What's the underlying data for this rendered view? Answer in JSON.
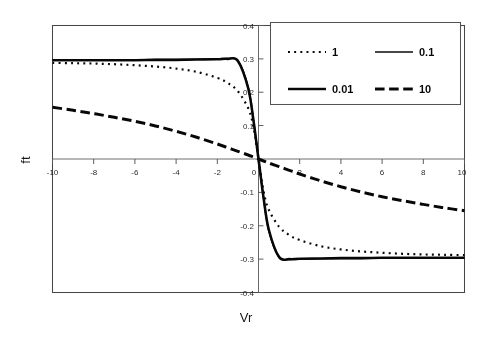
{
  "chart_data": {
    "type": "line",
    "title": "",
    "subtitle": "",
    "xlabel": "Vr",
    "ylabel": "ft",
    "xlim": [
      -10,
      10
    ],
    "ylim": [
      -0.4,
      0.4
    ],
    "grid": false,
    "legend_position": "top-right",
    "xticks": [
      -10,
      -8,
      -6,
      -4,
      -2,
      0,
      2,
      4,
      6,
      8,
      10
    ],
    "xtick_labels": [
      "-10",
      "-8",
      "-6",
      "-4",
      "-2",
      "0",
      "2",
      "4",
      "6",
      "8",
      "10"
    ],
    "yticks": [
      -0.4,
      -0.3,
      -0.2,
      -0.1,
      0,
      0.1,
      0.2,
      0.3,
      0.4
    ],
    "ytick_labels": [
      "-0.4",
      "-0.3",
      "-0.2",
      "-0.1",
      "0",
      "0.1",
      "0.2",
      "0.3",
      "0.4"
    ],
    "x": [
      -10,
      -9,
      -8,
      -7,
      -6,
      -5,
      -4,
      -3,
      -2,
      -1.5,
      -1,
      -0.5,
      -0.25,
      0,
      0.25,
      0.5,
      1,
      1.5,
      2,
      3,
      4,
      5,
      6,
      7,
      8,
      9,
      10
    ],
    "series": [
      {
        "name": "1",
        "label": "1",
        "style": "dotted",
        "width": 2.2,
        "color": "#111111",
        "values": [
          0.288,
          0.287,
          0.286,
          0.284,
          0.281,
          0.277,
          0.271,
          0.261,
          0.243,
          0.228,
          0.203,
          0.152,
          0.098,
          0.0,
          -0.098,
          -0.152,
          -0.203,
          -0.228,
          -0.243,
          -0.261,
          -0.271,
          -0.277,
          -0.281,
          -0.284,
          -0.286,
          -0.287,
          -0.288
        ]
      },
      {
        "name": "0.1",
        "label": "0.1",
        "style": "solid-thin",
        "width": 1.6,
        "color": "#111111",
        "values": [
          0.297,
          0.297,
          0.297,
          0.297,
          0.297,
          0.298,
          0.298,
          0.299,
          0.3,
          0.301,
          0.295,
          0.215,
          0.12,
          0.0,
          -0.12,
          -0.215,
          -0.295,
          -0.301,
          -0.3,
          -0.299,
          -0.298,
          -0.298,
          -0.297,
          -0.297,
          -0.297,
          -0.297,
          -0.297
        ]
      },
      {
        "name": "0.01",
        "label": "0.01",
        "style": "solid-thick",
        "width": 2.6,
        "color": "#111111",
        "values": [
          0.296,
          0.296,
          0.296,
          0.296,
          0.296,
          0.297,
          0.297,
          0.298,
          0.299,
          0.3,
          0.294,
          0.212,
          0.118,
          0.0,
          -0.118,
          -0.212,
          -0.294,
          -0.3,
          -0.299,
          -0.298,
          -0.297,
          -0.297,
          -0.296,
          -0.296,
          -0.296,
          -0.296,
          -0.296
        ]
      },
      {
        "name": "10",
        "label": "10",
        "style": "dashed",
        "width": 3.0,
        "color": "#111111",
        "values": [
          0.155,
          0.146,
          0.136,
          0.125,
          0.113,
          0.099,
          0.083,
          0.065,
          0.045,
          0.034,
          0.023,
          0.012,
          0.006,
          0.0,
          -0.006,
          -0.012,
          -0.023,
          -0.034,
          -0.045,
          -0.065,
          -0.083,
          -0.099,
          -0.113,
          -0.125,
          -0.136,
          -0.146,
          -0.155
        ]
      }
    ],
    "legend_entries": [
      {
        "label": "1",
        "style": "dotted",
        "row": 0,
        "col": 0
      },
      {
        "label": "0.1",
        "style": "solid-thin",
        "row": 0,
        "col": 1
      },
      {
        "label": "0.01",
        "style": "solid-thick",
        "row": 1,
        "col": 0
      },
      {
        "label": "10",
        "style": "dashed",
        "row": 1,
        "col": 1
      }
    ]
  }
}
